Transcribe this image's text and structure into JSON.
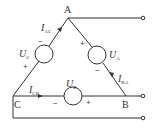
{
  "diagram": {
    "type": "delta-connected three-phase voltage sources",
    "nodes": {
      "A": "A",
      "B": "B",
      "C": "C"
    },
    "sources": [
      {
        "name": "UC",
        "symbol": "U",
        "sub": "C",
        "plus": "+",
        "minus": "−"
      },
      {
        "name": "UA",
        "symbol": "U",
        "sub": "A",
        "plus": "+",
        "minus": "−"
      },
      {
        "name": "UB",
        "symbol": "U",
        "sub": "B",
        "plus": "+",
        "minus": "−"
      }
    ],
    "currents": [
      {
        "name": "IAC",
        "symbol": "I",
        "sub": "AC"
      },
      {
        "name": "IBA",
        "symbol": "I",
        "sub": "BA"
      },
      {
        "name": "ICB",
        "symbol": "I",
        "sub": "CB"
      }
    ],
    "terminals": 3,
    "colors": {
      "line": "#333333",
      "background": "#ffffff"
    }
  }
}
